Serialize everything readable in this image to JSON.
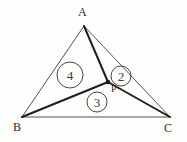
{
  "figure": {
    "background_color": "#fdfdfc",
    "line_color_thin": "#55534f",
    "line_color_thick": "#211f1e",
    "text_color": "#2b2b2b",
    "width": 187,
    "height": 142
  },
  "vertices": [
    {
      "name": "A",
      "label": "A",
      "x": 108,
      "y": 26,
      "label_x": 78,
      "label_y": 16
    },
    {
      "name": "B",
      "label": "B",
      "x": 22,
      "y": 117,
      "label_x": 13,
      "label_y": 131
    },
    {
      "name": "C",
      "label": "C",
      "x": 170,
      "y": 117,
      "label_x": 168,
      "label_y": 132
    }
  ],
  "interior_point": {
    "name": "P",
    "label": "P",
    "x": 108,
    "y": 82,
    "label_x": 111,
    "label_y": 92,
    "dot_radius": 2
  },
  "segments": [
    {
      "name": "edge-ab",
      "from": "A",
      "to": "B",
      "x1": 84,
      "y1": 26,
      "x2": 22,
      "y2": 117,
      "weight": "thin"
    },
    {
      "name": "edge-bc",
      "from": "B",
      "to": "C",
      "x1": 22,
      "y1": 117,
      "x2": 170,
      "y2": 117,
      "weight": "thin"
    },
    {
      "name": "edge-ac",
      "from": "A",
      "to": "C",
      "x1": 84,
      "y1": 26,
      "x2": 170,
      "y2": 117,
      "weight": "thin"
    },
    {
      "name": "cevian-ap",
      "from": "A",
      "to": "P",
      "x1": 84,
      "y1": 26,
      "x2": 108,
      "y2": 82,
      "weight": "thick"
    },
    {
      "name": "cevian-bp",
      "from": "B",
      "to": "P",
      "x1": 22,
      "y1": 117,
      "x2": 108,
      "y2": 82,
      "weight": "thick"
    },
    {
      "name": "cevian-pc",
      "from": "P",
      "to": "C",
      "x1": 108,
      "y1": 82,
      "x2": 170,
      "y2": 117,
      "weight": "thick"
    }
  ],
  "regions": [
    {
      "name": "region-4",
      "number": "4",
      "cx": 70,
      "cy": 75,
      "r": 13
    },
    {
      "name": "region-2",
      "number": "2",
      "cx": 121,
      "cy": 76,
      "r": 10
    },
    {
      "name": "region-3",
      "number": "3",
      "cx": 97,
      "cy": 102,
      "r": 10
    }
  ]
}
